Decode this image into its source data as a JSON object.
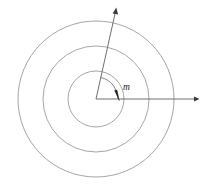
{
  "figure": {
    "type": "geometric-diagram",
    "background_color": "#ffffff",
    "canvas": {
      "width": 208,
      "height": 190
    },
    "center": {
      "x": 96,
      "y": 99
    },
    "circles": [
      {
        "name": "inner-circle",
        "radius": 28,
        "stroke": "#9a9a9a"
      },
      {
        "name": "middle-circle",
        "radius": 53,
        "stroke": "#9a9a9a"
      },
      {
        "name": "outer-circle",
        "radius": 78,
        "stroke": "#9a9a9a"
      }
    ],
    "rays": [
      {
        "name": "horizontal-ray",
        "from": {
          "x": 96,
          "y": 99
        },
        "to": {
          "x": 198,
          "y": 99
        },
        "angle_deg": 0,
        "arrowhead": true,
        "stroke": "#6f6f6f"
      },
      {
        "name": "inclined-ray",
        "from": {
          "x": 96,
          "y": 99
        },
        "to": {
          "x": 116,
          "y": 9
        },
        "angle_deg": 77,
        "arrowhead": true,
        "stroke": "#6f6f6f"
      }
    ],
    "angle_marker": {
      "name": "angle-arc",
      "label": "m",
      "label_style": "italic",
      "label_color": "#1a1a1a",
      "arc_radius": 22,
      "start_angle_deg": 0,
      "end_angle_deg": 77,
      "arrow_at": "horizontal-end",
      "label_position": {
        "x": 124,
        "y": 88
      }
    }
  }
}
